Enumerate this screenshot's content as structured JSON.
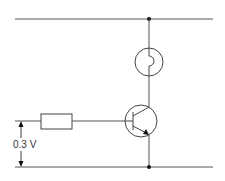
{
  "diagram": {
    "type": "transistor switch circuit",
    "components": {
      "lamp": {
        "name": "lamp",
        "symbol": "lamp-icon"
      },
      "transistor": {
        "name": "NPN transistor",
        "symbol": "npn-transistor-icon"
      },
      "resistor": {
        "name": "base resistor",
        "symbol": "resistor-icon"
      },
      "voltage_source": {
        "name": "input voltage",
        "label": "0.3 V"
      }
    },
    "rails": {
      "top": "positive supply rail",
      "bottom": "ground rail"
    },
    "voltage_label": "0.3 V",
    "colors": {
      "wire": "#555555",
      "component": "#444444",
      "junction": "#111111",
      "background": "#ffffff"
    }
  }
}
